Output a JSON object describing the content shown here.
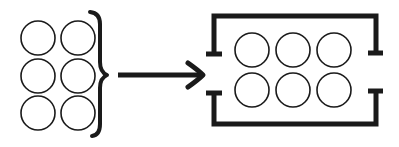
{
  "diagram": {
    "description": "Six loose circles grouped by a curly brace, arrow pointing to six circles arranged inside a bracketed container",
    "colors": {
      "stroke": "#1a1a1a",
      "background": "#ffffff"
    },
    "left_group": {
      "circles": [
        {
          "cx": 38,
          "cy": 38
        },
        {
          "cx": 78,
          "cy": 38
        },
        {
          "cx": 38,
          "cy": 76
        },
        {
          "cx": 78,
          "cy": 76
        },
        {
          "cx": 38,
          "cy": 113
        },
        {
          "cx": 78,
          "cy": 113
        }
      ],
      "radius": 17,
      "layout": "2 columns x 3 rows"
    },
    "brace": {
      "label": "grouping-brace"
    },
    "arrow": {
      "label": "transform-arrow"
    },
    "right_group": {
      "circles": [
        {
          "cx": 252,
          "cy": 50
        },
        {
          "cx": 293,
          "cy": 50
        },
        {
          "cx": 334,
          "cy": 50
        },
        {
          "cx": 252,
          "cy": 90
        },
        {
          "cx": 293,
          "cy": 90
        },
        {
          "cx": 334,
          "cy": 90
        }
      ],
      "radius": 17,
      "layout": "3 columns x 2 rows",
      "container": "open-sided bracket frame"
    }
  }
}
